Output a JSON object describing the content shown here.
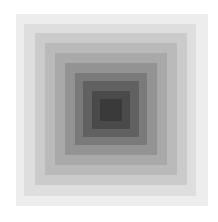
{
  "image": {
    "description": "Concentric grayscale squares, lightest outside to darkest center",
    "background": "#ffffff",
    "squares": [
      {
        "left": 16,
        "top": 14,
        "size": 192,
        "color": "#ededed"
      },
      {
        "left": 24,
        "top": 24,
        "size": 172,
        "color": "#dedede"
      },
      {
        "left": 35,
        "top": 33,
        "size": 152,
        "color": "#cbcbcb"
      },
      {
        "left": 45,
        "top": 43,
        "size": 132,
        "color": "#bababa"
      },
      {
        "left": 55,
        "top": 53,
        "size": 112,
        "color": "#a9a9a9"
      },
      {
        "left": 65,
        "top": 63,
        "size": 92,
        "color": "#939393"
      },
      {
        "left": 75,
        "top": 73,
        "size": 72,
        "color": "#7a7a7a"
      },
      {
        "left": 83,
        "top": 81,
        "size": 56,
        "color": "#616161"
      },
      {
        "left": 92,
        "top": 91,
        "size": 38,
        "color": "#4a4a4a"
      },
      {
        "left": 100,
        "top": 99,
        "size": 22,
        "color": "#3a3a3a"
      }
    ]
  }
}
